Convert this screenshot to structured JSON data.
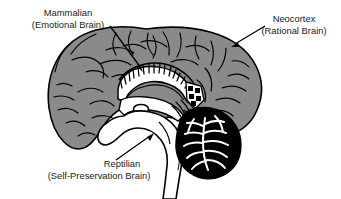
{
  "figure": {
    "background_color": "#ffffff",
    "cortex_fill": "#8a8a8a",
    "cerebellum_fill": "#000000",
    "inner_structures_fill": "#ffffff",
    "outline_color": "#000000",
    "text_color": "#1a1a1a"
  },
  "labels": [
    {
      "id": "mammalian",
      "line1": "Mammalian",
      "line2": "(Emotional Brain)",
      "anchor_x": 68,
      "line1_y": 16,
      "line2_y": 28,
      "points_to": "limbic-system"
    },
    {
      "id": "neocortex",
      "line1": "Neocortex",
      "line2": "(Rational Brain)",
      "anchor_x": 294,
      "line1_y": 22,
      "line2_y": 34,
      "points_to": "cerebral-cortex"
    },
    {
      "id": "reptilian",
      "line1": "Reptilian",
      "line2": "(Self-Preservation Brain)",
      "anchor_x": 99,
      "line1_y": 167,
      "line2_y": 179,
      "points_to": "brainstem"
    }
  ],
  "regions": [
    {
      "id": "cerebral-cortex",
      "name": "Neocortex",
      "color": "#8a8a8a"
    },
    {
      "id": "limbic-system",
      "name": "Mammalian brain",
      "color": "#ffffff"
    },
    {
      "id": "brainstem",
      "name": "Reptilian brain",
      "color": "#ffffff"
    },
    {
      "id": "cerebellum",
      "name": "Cerebellum",
      "color": "#000000"
    }
  ]
}
